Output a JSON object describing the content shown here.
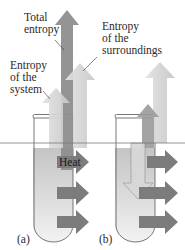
{
  "figure": {
    "labels": {
      "total_entropy": [
        "Total",
        "entropy"
      ],
      "entropy_surroundings": [
        "Entropy",
        "of the",
        "surroundings"
      ],
      "entropy_system": [
        "Entropy",
        "of the",
        "system"
      ],
      "heat": "Heat",
      "panel_a": "(a)",
      "panel_b": "(b)"
    },
    "colors": {
      "total_arrow": "#8c8c8c",
      "surroundings_arrow": "#d4d4d4",
      "system_arrow": "#c6c6c6",
      "heat_arrow": "#7a7a7a",
      "liquid": "#cfcfcf",
      "tube_outline": "#555555"
    }
  }
}
